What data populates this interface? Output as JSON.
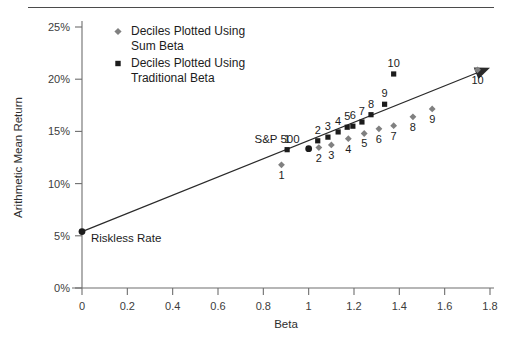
{
  "figure": {
    "name": "security-market-line-scatter",
    "background": "#ffffff",
    "has_top_rule": true
  },
  "legend": {
    "position": "top-left-inside",
    "entries": [
      {
        "marker": "diamond",
        "color": "#808080",
        "label_line1": "Deciles Plotted Using",
        "label_line2": "Sum Beta"
      },
      {
        "marker": "square",
        "color": "#1c1c1c",
        "label_line1": "Deciles Plotted Using",
        "label_line2": "Traditional Beta"
      }
    ]
  },
  "annotations": [
    {
      "name": "riskless-rate-annotation",
      "text": "Riskless Rate",
      "x": 0.0,
      "y": 5.4
    },
    {
      "name": "sp500-annotation",
      "text": "S&P 500",
      "x": 1.0,
      "y": 13.3
    }
  ],
  "colors": {
    "sum_beta_marker": "#808080",
    "traditional_beta_marker": "#1c1c1c",
    "axis": "#6e6e6e",
    "line": "#2a2a2a",
    "text": "#1c1c1c",
    "rule": "#4b4b4b"
  },
  "chart_data": {
    "type": "scatter",
    "title": "",
    "xlabel": "Beta",
    "ylabel": "Arithmetic Mean Return",
    "xlim": [
      0,
      1.8
    ],
    "ylim": [
      0,
      25
    ],
    "xticks": [
      0,
      0.2,
      0.4,
      0.6,
      0.8,
      1,
      1.2,
      1.4,
      1.6,
      1.8
    ],
    "xticklabels": [
      "0",
      "0.2",
      "0.4",
      "0.6",
      "0.8",
      "1",
      "1.2",
      "1.4",
      "1.6",
      "1.8"
    ],
    "yticks": [
      0,
      5,
      10,
      15,
      20,
      25
    ],
    "yticklabels": [
      "0%",
      "5%",
      "10%",
      "15%",
      "20%",
      "25%"
    ],
    "grid": false,
    "legend_position": "upper left",
    "series": [
      {
        "name": "Deciles Plotted Using Traditional Beta",
        "marker": "square",
        "color": "#1c1c1c",
        "point_labels": [
          "1",
          "2",
          "3",
          "4",
          "5",
          "6",
          "7",
          "8",
          "9",
          "10"
        ],
        "label_offset": "above",
        "x": [
          0.905,
          1.04,
          1.085,
          1.13,
          1.17,
          1.195,
          1.235,
          1.275,
          1.335,
          1.375
        ],
        "y": [
          13.25,
          14.1,
          14.45,
          14.95,
          15.4,
          15.5,
          15.9,
          16.6,
          17.6,
          20.5
        ]
      },
      {
        "name": "Deciles Plotted Using Sum Beta",
        "marker": "diamond",
        "color": "#808080",
        "point_labels": [
          "1",
          "2",
          "3",
          "4",
          "5",
          "6",
          "7",
          "8",
          "9",
          "10"
        ],
        "label_offset": "below",
        "x": [
          0.88,
          1.045,
          1.1,
          1.175,
          1.245,
          1.31,
          1.375,
          1.46,
          1.545,
          1.745
        ],
        "y": [
          11.8,
          13.45,
          13.7,
          14.3,
          14.8,
          15.25,
          15.55,
          16.4,
          17.15,
          20.9
        ]
      }
    ],
    "reference_points": [
      {
        "name": "riskless-rate",
        "label": "Riskless Rate",
        "marker": "circle",
        "color": "#1c1c1c",
        "x": 0.0,
        "y": 5.4
      },
      {
        "name": "sp500",
        "label": "S&P 500",
        "marker": "circle",
        "color": "#1c1c1c",
        "x": 1.0,
        "y": 13.35
      }
    ],
    "trend_line": {
      "name": "security-market-line",
      "from": {
        "x": 0.0,
        "y": 5.4
      },
      "to": {
        "x": 1.8,
        "y": 21.1
      },
      "arrow_at_end": true
    }
  }
}
